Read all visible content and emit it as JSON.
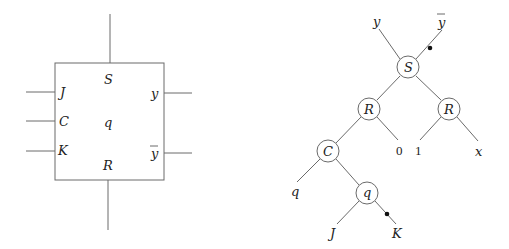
{
  "block": {
    "top_label": "S",
    "center_label": "q",
    "bottom_label": "R",
    "inputs": [
      {
        "label": "J",
        "y": 92
      },
      {
        "label": "C",
        "y": 121
      },
      {
        "label": "K",
        "y": 151
      }
    ],
    "outputs": [
      {
        "label": "y",
        "y": 93
      },
      {
        "label": "y",
        "bar": true,
        "y": 153
      }
    ]
  },
  "tree": {
    "root": {
      "label": "S"
    },
    "root_outputs": {
      "left": "y",
      "right": "y",
      "right_bar": true
    },
    "level1": [
      {
        "label": "R"
      },
      {
        "label": "R"
      }
    ],
    "level2": [
      {
        "label": "C"
      },
      {
        "label": "0"
      },
      {
        "label": "1"
      },
      {
        "label": "x"
      }
    ],
    "level3": [
      {
        "label": "q"
      },
      {
        "label": "q"
      }
    ],
    "level4": [
      {
        "label": "J"
      },
      {
        "label": "K"
      }
    ]
  }
}
